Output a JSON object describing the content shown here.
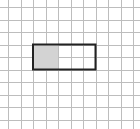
{
  "diagram": {
    "type": "grid-area-model",
    "grid": {
      "origin_x": 8,
      "origin_y": 7,
      "cell_size": 12.5,
      "columns": 10,
      "rows": 10,
      "line_color": "#bdbdbd",
      "background": "#ffffff"
    },
    "rectangle": {
      "col_start": 2,
      "row_start": 3,
      "width_cells": 5,
      "height_cells": 2,
      "border_color": "#222222",
      "border_width": 2
    },
    "shaded_region": {
      "col_start": 2,
      "row_start": 3,
      "width_cells": 2,
      "height_cells": 2,
      "fill_color": "#d3d3d3"
    }
  }
}
